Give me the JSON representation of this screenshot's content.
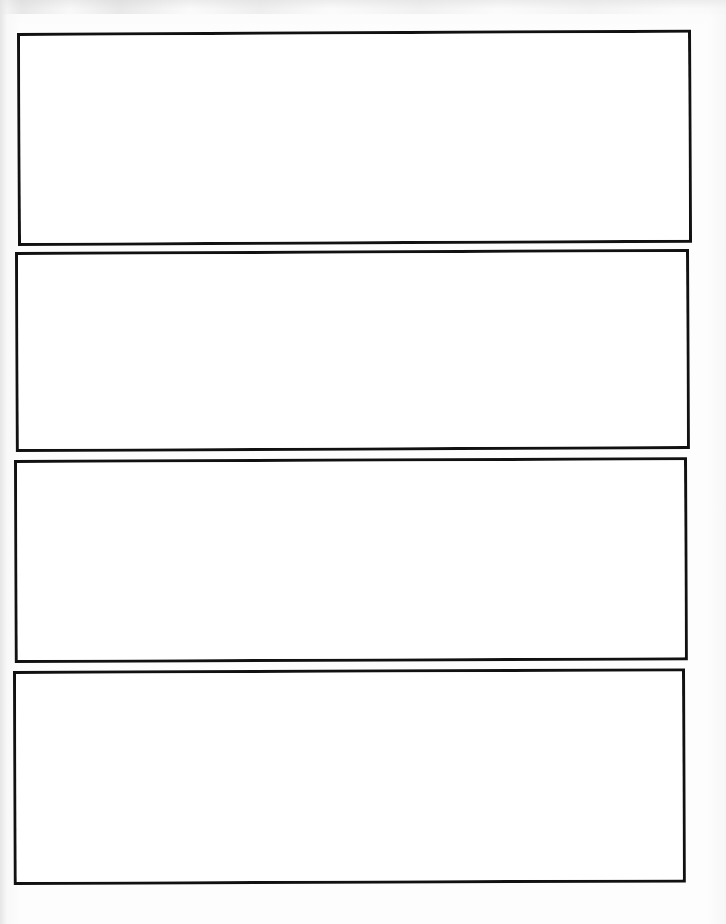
{
  "document": {
    "kind": "scanned-sheet",
    "title": "Blank four-panel template",
    "page_width": 726,
    "page_height": 924,
    "paper_color": "#fdfdfd",
    "ink_color": "#111111",
    "panel_count": 4,
    "panel_content_text": ""
  },
  "panels": [
    {
      "index": 1,
      "label": "",
      "content": "",
      "x": 17,
      "y": 33,
      "width": 674,
      "height": 213,
      "border_width": 3,
      "skew_deg": -0.28
    },
    {
      "index": 2,
      "label": "",
      "content": "",
      "x": 15,
      "y": 252,
      "width": 674,
      "height": 200,
      "border_width": 3,
      "skew_deg": -0.26
    },
    {
      "index": 3,
      "label": "",
      "content": "",
      "x": 14,
      "y": 460,
      "width": 673,
      "height": 203,
      "border_width": 3,
      "skew_deg": -0.24
    },
    {
      "index": 4,
      "label": "",
      "content": "",
      "x": 13,
      "y": 671,
      "width": 672,
      "height": 214,
      "border_width": 3,
      "skew_deg": -0.22
    }
  ]
}
